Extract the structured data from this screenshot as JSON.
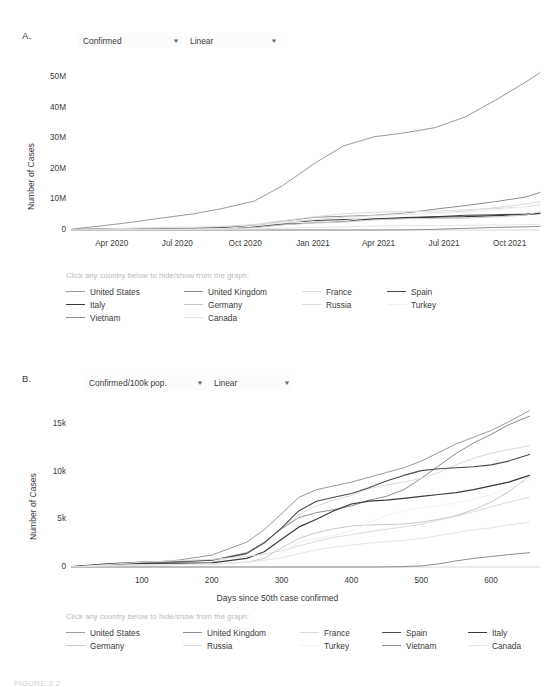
{
  "figure": {
    "caption_fragment": "FIGURE 2.2"
  },
  "panelA": {
    "letter": "A.",
    "controls": [
      {
        "name": "metric-select",
        "value": "Confirmed",
        "caret": "chevron-down-icon"
      },
      {
        "name": "scale-select",
        "value": "Linear",
        "caret": "chevron-down-icon"
      }
    ],
    "legend_note": "Click any country below to hide/show from the graph:",
    "legend": [
      {
        "label": "United States",
        "color": "#9a9a9a"
      },
      {
        "label": "United Kingdom",
        "color": "#8d8d8d"
      },
      {
        "label": "France",
        "color": "#dcdcdc"
      },
      {
        "label": "Spain",
        "color": "#4a4a4a"
      },
      {
        "label": "Italy",
        "color": "#3a3a3a"
      },
      {
        "label": "Germany",
        "color": "#c9c9c9"
      },
      {
        "label": "Russia",
        "color": "#dcdcdc"
      },
      {
        "label": "Turkey",
        "color": "#f2f2f2"
      },
      {
        "label": "Vietnam",
        "color": "#8d8d8d"
      },
      {
        "label": "Canada",
        "color": "#e4e4e4"
      }
    ]
  },
  "panelB": {
    "letter": "B.",
    "controls": [
      {
        "name": "metric-select",
        "value": "Confirmed/100k pop.",
        "caret": "chevron-down-icon"
      },
      {
        "name": "scale-select",
        "value": "Linear",
        "caret": "chevron-down-icon"
      }
    ],
    "legend_note": "Click any country below to hide/show from the graph:",
    "legend": [
      {
        "label": "United States",
        "color": "#9a9a9a"
      },
      {
        "label": "United Kingdom",
        "color": "#8d8d8d"
      },
      {
        "label": "France",
        "color": "#dcdcdc"
      },
      {
        "label": "Spain",
        "color": "#4a4a4a"
      },
      {
        "label": "Italy",
        "color": "#3a3a3a"
      },
      {
        "label": "Germany",
        "color": "#c9c9c9"
      },
      {
        "label": "Russia",
        "color": "#dcdcdc"
      },
      {
        "label": "Turkey",
        "color": "#f2f2f2"
      },
      {
        "label": "Vietnam",
        "color": "#8d8d8d"
      },
      {
        "label": "Canada",
        "color": "#e4e4e4"
      }
    ]
  },
  "chart_data": [
    {
      "id": "chartA",
      "type": "line",
      "title": "",
      "xlabel": "",
      "ylabel": "Number of Cases",
      "xticks": [
        "Apr 2020",
        "Jul 2020",
        "Oct 2020",
        "Jan 2021",
        "Apr 2021",
        "Jul 2021",
        "Oct 2021"
      ],
      "xtick_positions": [
        0.085,
        0.225,
        0.37,
        0.515,
        0.655,
        0.795,
        0.935
      ],
      "yticks": [
        "0",
        "10M",
        "20M",
        "30M",
        "40M",
        "50M"
      ],
      "yvalues": [
        0,
        10000000,
        20000000,
        30000000,
        40000000,
        50000000
      ],
      "ylim": [
        0,
        55000000
      ],
      "grid": false,
      "legend_position": "below",
      "x": [
        0.0,
        0.06,
        0.13,
        0.19,
        0.26,
        0.32,
        0.39,
        0.45,
        0.52,
        0.58,
        0.645,
        0.71,
        0.775,
        0.84,
        0.905,
        0.97,
        1.0
      ],
      "series": [
        {
          "name": "United States",
          "color": "#9a9a9a",
          "width": 1.0,
          "values": [
            0.3,
            1.3,
            2.6,
            3.9,
            5.3,
            7.0,
            9.5,
            14.5,
            22.0,
            27.5,
            30.5,
            31.8,
            33.5,
            37.0,
            42.5,
            48.5,
            51.5
          ]
        },
        {
          "name": "United Kingdom",
          "color": "#8d8d8d",
          "width": 1.0,
          "values": [
            0.1,
            0.25,
            0.32,
            0.4,
            0.55,
            0.9,
            1.6,
            2.9,
            4.2,
            4.5,
            4.8,
            5.5,
            6.8,
            8.0,
            9.3,
            10.8,
            12.3
          ]
        },
        {
          "name": "France",
          "color": "#dcdcdc",
          "width": 1.0,
          "values": [
            0.1,
            0.17,
            0.2,
            0.26,
            0.45,
            0.95,
            1.8,
            3.0,
            4.4,
            5.3,
            5.8,
            6.0,
            6.2,
            6.6,
            7.0,
            7.6,
            8.2
          ]
        },
        {
          "name": "Spain",
          "color": "#4a4a4a",
          "width": 1.1,
          "values": [
            0.15,
            0.24,
            0.28,
            0.33,
            0.45,
            0.75,
            1.3,
            2.0,
            3.1,
            3.4,
            3.6,
            3.8,
            4.3,
            4.8,
            5.0,
            5.2,
            5.5
          ]
        },
        {
          "name": "Italy",
          "color": "#3a3a3a",
          "width": 1.2,
          "values": [
            0.1,
            0.21,
            0.24,
            0.25,
            0.28,
            0.5,
            1.0,
            1.8,
            2.5,
            2.9,
            3.6,
            4.1,
            4.3,
            4.4,
            4.7,
            5.0,
            5.4
          ]
        },
        {
          "name": "Germany",
          "color": "#c9c9c9",
          "width": 1.0,
          "values": [
            0.07,
            0.16,
            0.19,
            0.2,
            0.23,
            0.31,
            0.75,
            1.7,
            2.3,
            2.6,
            3.3,
            3.7,
            3.75,
            3.9,
            4.3,
            4.9,
            6.0
          ]
        },
        {
          "name": "Russia",
          "color": "#dcdcdc",
          "width": 1.0,
          "values": [
            0.01,
            0.3,
            0.6,
            0.8,
            0.95,
            1.2,
            1.7,
            2.6,
            3.4,
            4.2,
            4.7,
            5.2,
            5.6,
            6.2,
            7.3,
            8.5,
            9.3
          ]
        },
        {
          "name": "Turkey",
          "color": "#f2f2f2",
          "width": 1.0,
          "values": [
            0.02,
            0.15,
            0.2,
            0.25,
            0.33,
            0.45,
            1.3,
            2.3,
            2.6,
            3.0,
            4.2,
            5.2,
            5.5,
            5.7,
            6.5,
            7.6,
            8.8
          ]
        },
        {
          "name": "Vietnam",
          "color": "#8d8d8d",
          "width": 1.0,
          "values": [
            0.0,
            0.0,
            0.0,
            0.0,
            0.0,
            0.0,
            0.0,
            0.0,
            0.0,
            0.0,
            0.01,
            0.02,
            0.2,
            0.55,
            0.85,
            1.05,
            1.2
          ]
        },
        {
          "name": "Canada",
          "color": "#e4e4e4",
          "width": 1.0,
          "values": [
            0.03,
            0.08,
            0.1,
            0.12,
            0.15,
            0.22,
            0.32,
            0.6,
            0.85,
            1.0,
            1.3,
            1.4,
            1.45,
            1.5,
            1.65,
            1.75,
            1.85
          ]
        }
      ],
      "value_unit": "millions"
    },
    {
      "id": "chartB",
      "type": "line",
      "title": "",
      "xlabel": "Days since 50th case confirmed",
      "ylabel": "Number of Cases",
      "xticks": [
        "100",
        "200",
        "300",
        "400",
        "500",
        "600"
      ],
      "xvalues": [
        100,
        200,
        300,
        400,
        500,
        600
      ],
      "xlim": [
        0,
        670
      ],
      "yticks": [
        "0",
        "5k",
        "10k",
        "15k"
      ],
      "yvalues": [
        0,
        5000,
        10000,
        15000
      ],
      "ylim": [
        0,
        17500
      ],
      "grid": false,
      "legend_position": "below",
      "x": [
        0,
        50,
        100,
        150,
        200,
        250,
        275,
        300,
        325,
        350,
        375,
        400,
        425,
        450,
        475,
        500,
        525,
        550,
        575,
        600,
        625,
        655
      ],
      "series": [
        {
          "name": "United States",
          "color": "#9a9a9a",
          "width": 1.0,
          "values": [
            20,
            180,
            420,
            700,
            1250,
            2600,
            3900,
            5600,
            7300,
            8100,
            8500,
            8900,
            9400,
            9900,
            10400,
            11100,
            12000,
            12900,
            13600,
            14300,
            15200,
            16400
          ]
        },
        {
          "name": "United Kingdom",
          "color": "#8d8d8d",
          "width": 1.0,
          "values": [
            15,
            200,
            380,
            520,
            700,
            1500,
            2600,
            4000,
            5200,
            5700,
            6000,
            6400,
            7000,
            7400,
            8100,
            9300,
            10600,
            11900,
            13000,
            13900,
            14900,
            15800
          ]
        },
        {
          "name": "France",
          "color": "#dcdcdc",
          "width": 1.0,
          "values": [
            30,
            190,
            290,
            330,
            500,
            1400,
            2500,
            4100,
            5500,
            6400,
            7000,
            7500,
            8200,
            8600,
            8900,
            9300,
            9900,
            10700,
            11400,
            11900,
            12300,
            12700
          ]
        },
        {
          "name": "Spain",
          "color": "#4a4a4a",
          "width": 1.1,
          "values": [
            45,
            330,
            520,
            580,
            700,
            1400,
            2500,
            4100,
            5900,
            6900,
            7300,
            7700,
            8300,
            9000,
            9600,
            10100,
            10300,
            10400,
            10500,
            10700,
            11100,
            11800
          ]
        },
        {
          "name": "Italy",
          "color": "#3a3a3a",
          "width": 1.2,
          "values": [
            25,
            250,
            380,
            400,
            430,
            900,
            1600,
            2900,
            4200,
            5000,
            5900,
            6600,
            6900,
            7000,
            7200,
            7400,
            7600,
            7800,
            8100,
            8500,
            8900,
            9600
          ]
        },
        {
          "name": "Germany",
          "color": "#c9c9c9",
          "width": 1.0,
          "values": [
            12,
            170,
            230,
            250,
            280,
            500,
            900,
            2000,
            3000,
            3600,
            4000,
            4300,
            4400,
            4450,
            4500,
            4700,
            5000,
            5400,
            6000,
            6800,
            7900,
            9500
          ]
        },
        {
          "name": "Russia",
          "color": "#dcdcdc",
          "width": 1.0,
          "values": [
            5,
            250,
            500,
            650,
            800,
            1100,
            1350,
            1700,
            2200,
            2700,
            3100,
            3400,
            3700,
            3950,
            4200,
            4500,
            4900,
            5300,
            5800,
            6300,
            6800,
            7300
          ]
        },
        {
          "name": "Turkey",
          "color": "#f2f2f2",
          "width": 1.0,
          "values": [
            8,
            160,
            210,
            250,
            300,
            450,
            700,
            1500,
            2600,
            3000,
            3300,
            3800,
            4600,
            5400,
            5900,
            6200,
            6400,
            6700,
            7100,
            7600,
            8300,
            9100
          ]
        },
        {
          "name": "Vietnam",
          "color": "#8d8d8d",
          "width": 1.0,
          "values": [
            0,
            0,
            0,
            0,
            0,
            0,
            0,
            0,
            0,
            0,
            0,
            0,
            5,
            15,
            40,
            120,
            330,
            640,
            900,
            1100,
            1300,
            1500
          ]
        },
        {
          "name": "Canada",
          "color": "#e4e4e4",
          "width": 1.0,
          "values": [
            10,
            120,
            200,
            260,
            330,
            520,
            700,
            950,
            1400,
            1800,
            2100,
            2300,
            2500,
            2650,
            2800,
            3000,
            3300,
            3600,
            3900,
            4100,
            4400,
            4700
          ]
        }
      ]
    }
  ]
}
